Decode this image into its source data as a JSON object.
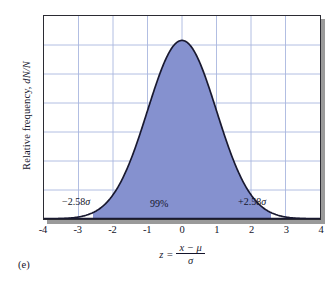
{
  "figure": {
    "caption": "(e)"
  },
  "axes": {
    "ylabel_prefix": "Relative frequency, ",
    "ylabel_symbol": "dN/N",
    "xlabel_lhs": "z",
    "xlabel_equals": "=",
    "xlabel_numerator": "x − μ",
    "xlabel_denominator": "σ"
  },
  "annotations": {
    "left": "−2.58",
    "left_symbol": "σ",
    "center": "99%",
    "right": "+2.58",
    "right_symbol": "σ"
  },
  "colors": {
    "fill": "#8591cf",
    "curve": "#191930",
    "grid": "#a8b6de",
    "frame": "#2b2b33",
    "shadow": "#9a9a9a",
    "background": "#ffffff",
    "text": "#14142b"
  },
  "chart_data": {
    "type": "area",
    "title": "",
    "xlabel": "z = (x − μ) / σ",
    "ylabel": "Relative frequency, dN/N",
    "xlim": [
      -4,
      4
    ],
    "ylim": [
      0,
      0.4535
    ],
    "xticks": [
      -4,
      -3,
      -2,
      -1,
      0,
      1,
      2,
      3,
      4
    ],
    "xticklabels": [
      "-4",
      "-3",
      "-2",
      "-1",
      "0",
      "1",
      "2",
      "3",
      "4"
    ],
    "yticks": [],
    "yticklabels": [],
    "grid": true,
    "grid_vertical_at": [
      -3,
      -2,
      -1,
      0,
      1,
      2,
      3
    ],
    "grid_horizontal_count": 6,
    "legend": null,
    "curve": {
      "name": "Standard normal distribution",
      "distribution": "gaussian",
      "mean": 0,
      "sigma": 1,
      "peak_value": 0.3989,
      "formula": "(1/sqrt(2*pi)) * exp(-z^2/2)",
      "x": [
        -4.0,
        -3.5,
        -3.0,
        -2.58,
        -2.5,
        -2.0,
        -1.5,
        -1.0,
        -0.5,
        0.0,
        0.5,
        1.0,
        1.5,
        2.0,
        2.5,
        2.58,
        3.0,
        3.5,
        4.0
      ],
      "y": [
        0.0001,
        0.0009,
        0.0044,
        0.0143,
        0.0175,
        0.054,
        0.1295,
        0.242,
        0.3521,
        0.3989,
        0.3521,
        0.242,
        0.1295,
        0.054,
        0.0175,
        0.0143,
        0.0044,
        0.0009,
        0.0001
      ]
    },
    "shaded_region": {
      "label": "99%",
      "from": -2.58,
      "to": 2.58,
      "area_fraction": 0.99,
      "boundary_labels": [
        "−2.58σ",
        "+2.58σ"
      ]
    }
  }
}
